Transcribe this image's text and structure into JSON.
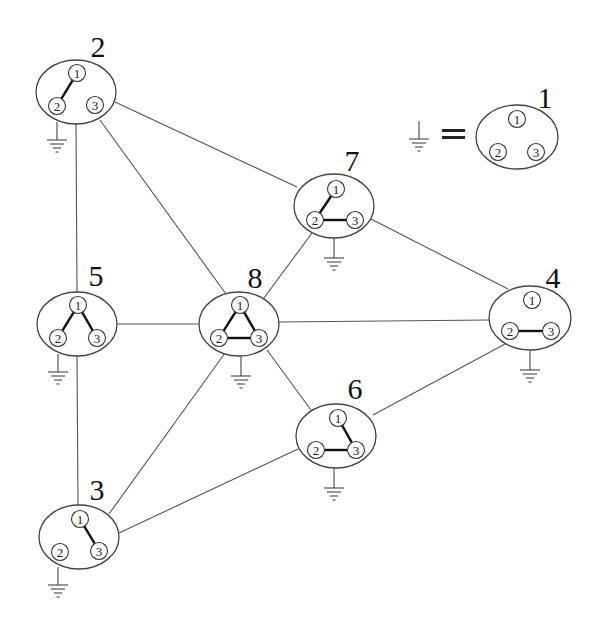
{
  "diagram": {
    "type": "network-graph",
    "legend": {
      "ground_symbol": "ground-icon",
      "equals": "=",
      "node": {
        "id": "1",
        "label": "1",
        "cx": 517,
        "cy": 137,
        "rx": 41,
        "ry": 32,
        "label_x": 545,
        "label_y": 108,
        "ports": [
          {
            "id": "1",
            "label": "1",
            "x": 517,
            "y": 119
          },
          {
            "id": "2",
            "label": "2",
            "x": 498,
            "y": 152
          },
          {
            "id": "3",
            "label": "3",
            "x": 536,
            "y": 152
          }
        ],
        "links": [],
        "ground": null
      },
      "ground_x": 419,
      "ground_y": 121
    },
    "nodes": [
      {
        "id": "2",
        "label": "2",
        "cx": 76,
        "cy": 92,
        "rx": 40,
        "ry": 32,
        "label_x": 98,
        "label_y": 57,
        "ports": [
          {
            "id": "1",
            "label": "1",
            "x": 77,
            "y": 73
          },
          {
            "id": "2",
            "label": "2",
            "x": 57,
            "y": 106
          },
          {
            "id": "3",
            "label": "3",
            "x": 95,
            "y": 105
          }
        ],
        "links": [
          [
            "1",
            "2"
          ]
        ],
        "ground": {
          "x": 57,
          "y1": 122,
          "y2": 140
        }
      },
      {
        "id": "7",
        "label": "7",
        "cx": 334,
        "cy": 206,
        "rx": 40,
        "ry": 32,
        "label_x": 352,
        "label_y": 171,
        "ports": [
          {
            "id": "1",
            "label": "1",
            "x": 336,
            "y": 189
          },
          {
            "id": "2",
            "label": "2",
            "x": 315,
            "y": 220
          },
          {
            "id": "3",
            "label": "3",
            "x": 355,
            "y": 220
          }
        ],
        "links": [
          [
            "1",
            "2"
          ],
          [
            "2",
            "3"
          ]
        ],
        "ground": {
          "x": 334,
          "y1": 238,
          "y2": 258
        }
      },
      {
        "id": "5",
        "label": "5",
        "cx": 77,
        "cy": 324,
        "rx": 40,
        "ry": 32,
        "label_x": 96,
        "label_y": 286,
        "ports": [
          {
            "id": "1",
            "label": "1",
            "x": 78,
            "y": 305
          },
          {
            "id": "2",
            "label": "2",
            "x": 58,
            "y": 338
          },
          {
            "id": "3",
            "label": "3",
            "x": 97,
            "y": 338
          }
        ],
        "links": [
          [
            "1",
            "2"
          ],
          [
            "1",
            "3"
          ]
        ],
        "ground": {
          "x": 58,
          "y1": 354,
          "y2": 372
        }
      },
      {
        "id": "8",
        "label": "8",
        "cx": 239,
        "cy": 324,
        "rx": 40,
        "ry": 32,
        "label_x": 255,
        "label_y": 288,
        "ports": [
          {
            "id": "1",
            "label": "1",
            "x": 240,
            "y": 305
          },
          {
            "id": "2",
            "label": "2",
            "x": 219,
            "y": 338
          },
          {
            "id": "3",
            "label": "3",
            "x": 259,
            "y": 338
          }
        ],
        "links": [
          [
            "1",
            "2"
          ],
          [
            "2",
            "3"
          ],
          [
            "1",
            "3"
          ]
        ],
        "ground": {
          "x": 241,
          "y1": 356,
          "y2": 376
        }
      },
      {
        "id": "4",
        "label": "4",
        "cx": 530,
        "cy": 318,
        "rx": 41,
        "ry": 32,
        "label_x": 553,
        "label_y": 288,
        "ports": [
          {
            "id": "1",
            "label": "1",
            "x": 532,
            "y": 300
          },
          {
            "id": "2",
            "label": "2",
            "x": 510,
            "y": 331
          },
          {
            "id": "3",
            "label": "3",
            "x": 551,
            "y": 331
          }
        ],
        "links": [
          [
            "2",
            "3"
          ]
        ],
        "ground": {
          "x": 530,
          "y1": 350,
          "y2": 370
        }
      },
      {
        "id": "6",
        "label": "6",
        "cx": 336,
        "cy": 436,
        "rx": 40,
        "ry": 32,
        "label_x": 355,
        "label_y": 399,
        "ports": [
          {
            "id": "1",
            "label": "1",
            "x": 338,
            "y": 418
          },
          {
            "id": "2",
            "label": "2",
            "x": 316,
            "y": 450
          },
          {
            "id": "3",
            "label": "3",
            "x": 356,
            "y": 450
          }
        ],
        "links": [
          [
            "1",
            "3"
          ],
          [
            "2",
            "3"
          ]
        ],
        "ground": {
          "x": 334,
          "y1": 468,
          "y2": 488
        }
      },
      {
        "id": "3",
        "label": "3",
        "cx": 79,
        "cy": 537,
        "rx": 40,
        "ry": 32,
        "label_x": 97,
        "label_y": 500,
        "ports": [
          {
            "id": "1",
            "label": "1",
            "x": 80,
            "y": 519
          },
          {
            "id": "2",
            "label": "2",
            "x": 60,
            "y": 552
          },
          {
            "id": "3",
            "label": "3",
            "x": 99,
            "y": 551
          }
        ],
        "links": [
          [
            "1",
            "3"
          ]
        ],
        "ground": {
          "x": 58,
          "y1": 567,
          "y2": 585
        }
      }
    ],
    "edges": [
      {
        "from": "2",
        "to": "5",
        "x1": 76,
        "y1": 124,
        "x2": 77,
        "y2": 292
      },
      {
        "from": "2",
        "to": "8",
        "x1": 100,
        "y1": 120,
        "x2": 226,
        "y2": 294
      },
      {
        "from": "2",
        "to": "7",
        "x1": 115,
        "y1": 102,
        "x2": 297,
        "y2": 187
      },
      {
        "from": "5",
        "to": "8",
        "x1": 117,
        "y1": 324,
        "x2": 199,
        "y2": 324
      },
      {
        "from": "5",
        "to": "3",
        "x1": 77,
        "y1": 356,
        "x2": 78,
        "y2": 505
      },
      {
        "from": "8",
        "to": "7",
        "x1": 264,
        "y1": 298,
        "x2": 312,
        "y2": 233
      },
      {
        "from": "8",
        "to": "4",
        "x1": 279,
        "y1": 322,
        "x2": 489,
        "y2": 320
      },
      {
        "from": "8",
        "to": "6",
        "x1": 267,
        "y1": 350,
        "x2": 311,
        "y2": 410
      },
      {
        "from": "8",
        "to": "3",
        "x1": 225,
        "y1": 353,
        "x2": 109,
        "y2": 514
      },
      {
        "from": "7",
        "to": "4",
        "x1": 371,
        "y1": 219,
        "x2": 508,
        "y2": 289
      },
      {
        "from": "4",
        "to": "6",
        "x1": 505,
        "y1": 344,
        "x2": 373,
        "y2": 415
      },
      {
        "from": "6",
        "to": "3",
        "x1": 298,
        "y1": 449,
        "x2": 119,
        "y2": 533
      }
    ]
  }
}
